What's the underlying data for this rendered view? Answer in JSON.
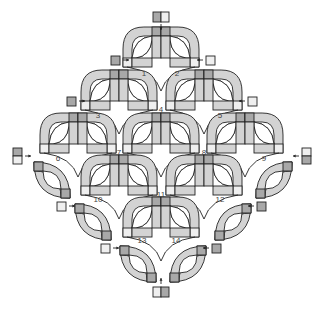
{
  "diagram": {
    "type": "quilt-assembly-diagram",
    "pattern": "double wedding ring style arcs",
    "colors": {
      "ink": "#222222",
      "arc_fill": "#d3d3d3",
      "dark_square": "#a8a8a8",
      "light_square": "#efefef",
      "background": "#ffffff"
    },
    "labels": [
      "1",
      "2",
      "3",
      "4",
      "5",
      "6",
      "7",
      "8",
      "9",
      "10",
      "11",
      "12",
      "13",
      "14"
    ],
    "label_positions": [
      {
        "text": "1",
        "x": 144,
        "y": 76
      },
      {
        "text": "2",
        "x": 177,
        "y": 76
      },
      {
        "text": "3",
        "x": 98,
        "y": 118
      },
      {
        "text": "4",
        "x": 161,
        "y": 112
      },
      {
        "text": "5",
        "x": 220,
        "y": 118
      },
      {
        "text": "6",
        "x": 58,
        "y": 161
      },
      {
        "text": "7",
        "x": 119,
        "y": 155
      },
      {
        "text": "8",
        "x": 204,
        "y": 155
      },
      {
        "text": "9",
        "x": 264,
        "y": 161
      },
      {
        "text": "10",
        "x": 98,
        "y": 202
      },
      {
        "text": "11",
        "x": 161,
        "y": 197
      },
      {
        "text": "12",
        "x": 220,
        "y": 202
      },
      {
        "text": "13",
        "x": 142,
        "y": 243
      },
      {
        "text": "14",
        "x": 176,
        "y": 243
      }
    ],
    "double_units": [
      {
        "cx": 161,
        "top": 27
      },
      {
        "cx": 119,
        "top": 70
      },
      {
        "cx": 204,
        "top": 70
      },
      {
        "cx": 78,
        "top": 113
      },
      {
        "cx": 161,
        "top": 113
      },
      {
        "cx": 245,
        "top": 113
      },
      {
        "cx": 119,
        "top": 155
      },
      {
        "cx": 204,
        "top": 155
      },
      {
        "cx": 161,
        "top": 197
      }
    ],
    "single_units": [
      {
        "x": 34,
        "y": 162,
        "dir": "left"
      },
      {
        "x": 256,
        "y": 162,
        "dir": "right"
      },
      {
        "x": 75,
        "y": 204,
        "dir": "left"
      },
      {
        "x": 215,
        "y": 204,
        "dir": "right"
      },
      {
        "x": 120,
        "y": 246,
        "dir": "left"
      },
      {
        "x": 170,
        "y": 246,
        "dir": "right"
      }
    ],
    "loose_squares": [
      {
        "x": 153,
        "y": 12,
        "w": 16,
        "h": 10,
        "split": "h",
        "shades": [
          "dark",
          "light"
        ]
      },
      {
        "x": 111,
        "y": 56,
        "w": 9,
        "h": 9,
        "shades": [
          "dark"
        ]
      },
      {
        "x": 206,
        "y": 56,
        "w": 9,
        "h": 9,
        "shades": [
          "light"
        ]
      },
      {
        "x": 67,
        "y": 97,
        "w": 9,
        "h": 9,
        "shades": [
          "dark"
        ]
      },
      {
        "x": 248,
        "y": 97,
        "w": 9,
        "h": 9,
        "shades": [
          "light"
        ]
      },
      {
        "x": 13,
        "y": 148,
        "w": 9,
        "h": 16,
        "split": "v",
        "shades": [
          "dark",
          "light"
        ]
      },
      {
        "x": 302,
        "y": 148,
        "w": 9,
        "h": 16,
        "split": "v",
        "shades": [
          "light",
          "dark"
        ]
      },
      {
        "x": 57,
        "y": 202,
        "w": 9,
        "h": 9,
        "shades": [
          "light"
        ]
      },
      {
        "x": 257,
        "y": 202,
        "w": 9,
        "h": 9,
        "shades": [
          "dark"
        ]
      },
      {
        "x": 101,
        "y": 244,
        "w": 9,
        "h": 9,
        "shades": [
          "light"
        ]
      },
      {
        "x": 212,
        "y": 244,
        "w": 9,
        "h": 9,
        "shades": [
          "dark"
        ]
      },
      {
        "x": 153,
        "y": 287,
        "w": 16,
        "h": 10,
        "split": "h",
        "shades": [
          "light",
          "dark"
        ]
      }
    ]
  }
}
